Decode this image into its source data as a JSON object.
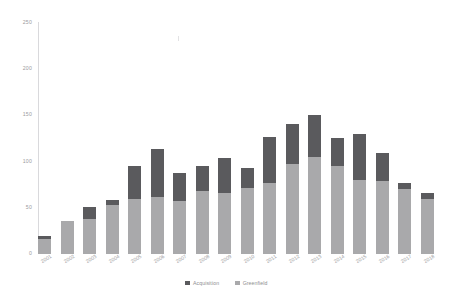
{
  "chart_data": {
    "type": "bar",
    "stacked": true,
    "title": "",
    "subtitle": "",
    "xlabel": "",
    "ylabel": "",
    "ylim": [
      0,
      250
    ],
    "yticks": [
      "0",
      "50",
      "100",
      "150",
      "200",
      "250"
    ],
    "ytick_values": [
      0,
      50,
      100,
      150,
      200,
      250
    ],
    "grid": false,
    "legend_position": "bottom",
    "categories": [
      "2001",
      "2002",
      "2003",
      "2004",
      "2005",
      "2006",
      "2007",
      "2008",
      "2009",
      "2010",
      "2011",
      "2012",
      "2013",
      "2014",
      "2015",
      "2016",
      "2017",
      "2018"
    ],
    "series": [
      {
        "name": "Acquisition",
        "color": "#5a5a5d",
        "values": [
          3,
          0,
          13,
          5,
          35,
          52,
          31,
          27,
          38,
          22,
          50,
          44,
          45,
          31,
          50,
          30,
          7,
          6
        ]
      },
      {
        "name": "Greenfield",
        "color": "#a9a9ab",
        "values": [
          16,
          36,
          38,
          53,
          60,
          62,
          57,
          68,
          66,
          71,
          77,
          97,
          105,
          95,
          80,
          79,
          70,
          60
        ]
      }
    ],
    "totals": [
      19,
      36,
      51,
      58,
      95,
      114,
      88,
      95,
      104,
      93,
      127,
      141,
      150,
      126,
      130,
      109,
      77,
      66
    ]
  },
  "legend": {
    "items": [
      {
        "label": "Acquisition",
        "color": "#5a5a5d"
      },
      {
        "label": "Greenfield",
        "color": "#a9a9ab"
      }
    ]
  },
  "colors": {
    "acquisition": "#5a5a5d",
    "greenfield": "#a9a9ab",
    "axis": "#d9d9dc",
    "tick_text": "#9b9b9e",
    "background": "#ffffff"
  }
}
